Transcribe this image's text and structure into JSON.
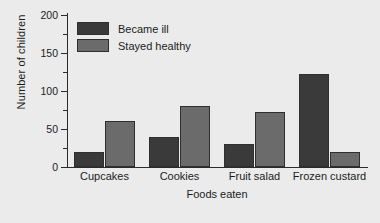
{
  "chart_data": {
    "type": "bar",
    "title": "",
    "xlabel": "Foods eaten",
    "ylabel": "Number of children",
    "categories": [
      "Cupcakes",
      "Cookies",
      "Fruit salad",
      "Frozen custard"
    ],
    "series": [
      {
        "name": "Became ill",
        "values": [
          20,
          40,
          30,
          122
        ],
        "color": "#3a3a3a"
      },
      {
        "name": "Stayed healthy",
        "values": [
          60,
          80,
          72,
          20
        ],
        "color": "#6b6b6b"
      }
    ],
    "ylim": [
      0,
      200
    ],
    "yticks": [
      0,
      50,
      100,
      150,
      200
    ],
    "ytick_labels": [
      "0",
      "50",
      "100",
      "150",
      "200"
    ],
    "yminor_ticks": [
      25,
      75,
      125,
      175
    ],
    "grid": false,
    "legend_position": "upper-left-inside",
    "background_color": "#ebebeb",
    "axis_color": "#2b2b2b"
  },
  "legend": {
    "items": [
      {
        "label": "Became ill"
      },
      {
        "label": "Stayed healthy"
      }
    ]
  },
  "axes": {
    "y_title": "Number of children",
    "x_title": "Foods eaten"
  }
}
